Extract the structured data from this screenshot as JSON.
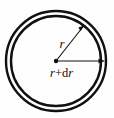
{
  "figure": {
    "type": "geometry-diagram",
    "background_color": "#fefefe",
    "stroke_color": "#111111",
    "labels": {
      "inner_radius": "r",
      "outer_radius_prefix": "r",
      "outer_radius_plus": "+",
      "outer_radius_differential_d": "d",
      "outer_radius_differential_r": "r",
      "outer_radius_full": "r+dr"
    },
    "geometry": {
      "center_x": 56,
      "center_y": 61,
      "inner_radius_px": 45,
      "outer_radius_px": 50,
      "center_dot_radius_px": 2.2,
      "stroke_width_outer": 2.4,
      "stroke_width_inner": 2.4,
      "arrow_stroke_width": 1.1,
      "inner_arrow_angle_deg": -52,
      "outer_arrow_angle_deg": 0
    }
  }
}
